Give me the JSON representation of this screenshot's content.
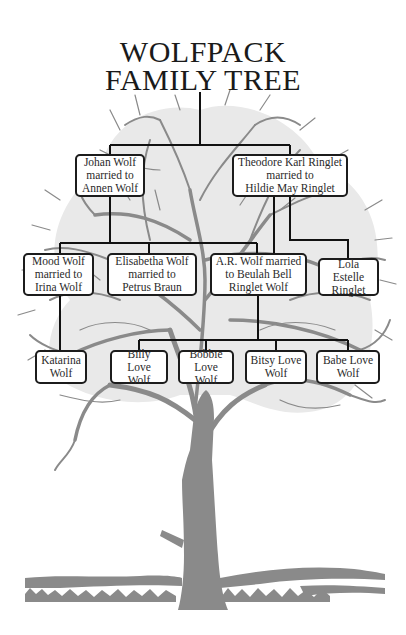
{
  "title": {
    "line1": "WOLFPACK",
    "line2": "FAMILY TREE"
  },
  "colors": {
    "tree": "#8a8a8a",
    "connector": "#111111",
    "box_border": "#1c1c1c",
    "text": "#2a2a2a"
  },
  "generations": [
    {
      "level": 1,
      "members": [
        {
          "id": "johan",
          "label": "Johan Wolf\nmarried to\nAnnen Wolf"
        },
        {
          "id": "theodore",
          "label": "Theodore Karl Ringlet\nmarried to\nHildie May Ringlet"
        }
      ]
    },
    {
      "level": 2,
      "members": [
        {
          "id": "mood",
          "label": "Mood Wolf\nmarried to\nIrina Wolf",
          "parent": "johan"
        },
        {
          "id": "elisabetha",
          "label": "Elisabetha Wolf\nmarried to\nPetrus Braun",
          "parent": "johan"
        },
        {
          "id": "ar",
          "label": "A.R. Wolf married\nto Beulah Bell\nRinglet Wolf",
          "parent": "johan + theodore"
        },
        {
          "id": "lola",
          "label": "Lola Estelle\nRinglet",
          "parent": "theodore"
        }
      ]
    },
    {
      "level": 3,
      "members": [
        {
          "id": "katarina",
          "label": "Katarina\nWolf",
          "parent": "mood"
        },
        {
          "id": "billy",
          "label": "Billy Love\nWolf",
          "parent": "ar"
        },
        {
          "id": "bobbie",
          "label": "Bobbie\nLove Wolf",
          "parent": "ar"
        },
        {
          "id": "bitsy",
          "label": "Bitsy Love\nWolf",
          "parent": "ar"
        },
        {
          "id": "babe",
          "label": "Babe Love\nWolf",
          "parent": "ar"
        }
      ]
    }
  ],
  "nodes": {
    "johan": "Johan Wolf\nmarried to\nAnnen Wolf",
    "theodore": "Theodore Karl Ringlet\nmarried to\nHildie May Ringlet",
    "mood": "Mood Wolf\nmarried to\nIrina Wolf",
    "elisabetha": "Elisabetha Wolf\nmarried to\nPetrus Braun",
    "ar": "A.R. Wolf married\nto Beulah Bell\nRinglet Wolf",
    "lola": "Lola Estelle\nRinglet",
    "katarina": "Katarina\nWolf",
    "billy": "Billy Love\nWolf",
    "bobbie": "Bobbie\nLove Wolf",
    "bitsy": "Bitsy Love\nWolf",
    "babe": "Babe Love\nWolf"
  }
}
